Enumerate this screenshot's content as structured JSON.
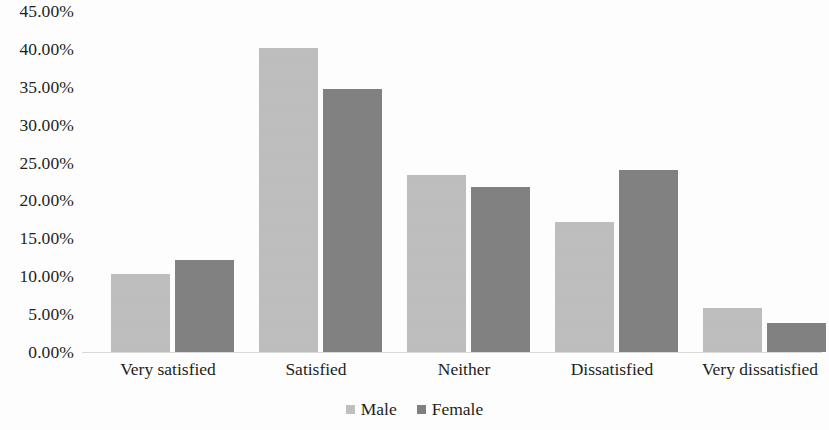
{
  "chart_data": {
    "type": "bar",
    "title": "",
    "xlabel": "",
    "ylabel": "",
    "categories": [
      "Very satisfied",
      "Satisfied",
      "Neither",
      "Dissatisfied",
      "Very dissatisfied"
    ],
    "series": [
      {
        "name": "Male",
        "color": "#bfbfbf",
        "values": [
          10.3,
          40.1,
          23.3,
          17.2,
          5.8
        ]
      },
      {
        "name": "Female",
        "color": "#808080",
        "values": [
          12.2,
          34.7,
          21.8,
          24.0,
          3.8
        ]
      }
    ],
    "ylim": [
      0,
      45
    ],
    "ytick_values": [
      45,
      40,
      35,
      30,
      25,
      20,
      15,
      10,
      5,
      0
    ],
    "ytick_labels": [
      "45.00%",
      "40.00%",
      "35.00%",
      "30.00%",
      "25.00%",
      "20.00%",
      "15.00%",
      "10.00%",
      "5.00%",
      "0.00%"
    ],
    "grid": false,
    "legend_position": "bottom",
    "legend_entries": [
      "Male",
      "Female"
    ]
  }
}
